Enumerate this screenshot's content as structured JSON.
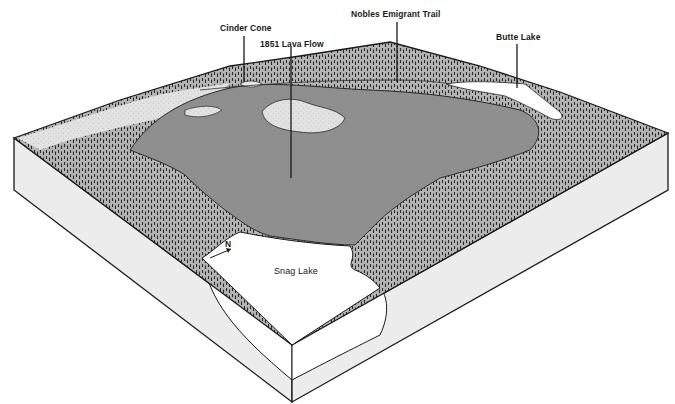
{
  "diagram": {
    "type": "block-diagram",
    "colors": {
      "background": "#ffffff",
      "forest": "#8c8c8c",
      "tree_marks": "#2a2a2a",
      "lava_flow": "#8a8a8a",
      "lava_fields_light": "#d8d8d8",
      "lake": "#ffffff",
      "block_side": "#e9e9e9",
      "outline": "#1a1a1a"
    }
  },
  "labels": {
    "cinder_cone": "Cinder Cone",
    "lava_flow": "1851 Lava Flow",
    "emigrant_trail": "Nobles Emigrant Trail",
    "butte_lake": "Butte Lake",
    "snag_lake": "Snag Lake",
    "north_arrow": "N"
  }
}
